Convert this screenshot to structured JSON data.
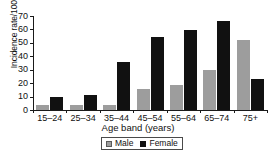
{
  "chart_data": {
    "type": "bar",
    "title": "",
    "xlabel": "Age band (years)",
    "ylabel": "Incidence rate/100 000",
    "categories": [
      "15–24",
      "25–34",
      "35–44",
      "45–54",
      "55–64",
      "65–74",
      "75+"
    ],
    "series": [
      {
        "name": "Male",
        "color": "#9d9d9d",
        "values": [
          3.5,
          3.5,
          3.5,
          16,
          19,
          30,
          52
        ]
      },
      {
        "name": "Female",
        "color": "#111111",
        "values": [
          9.5,
          11.5,
          36,
          54.5,
          59.5,
          66.5,
          23
        ]
      }
    ],
    "ylim": [
      0,
      70
    ],
    "yticks": [
      0,
      10,
      20,
      30,
      40,
      50,
      60,
      70
    ],
    "ytick_labels": [
      "0",
      "10",
      "20",
      "30",
      "40",
      "50",
      "60",
      "70"
    ],
    "grid": false,
    "legend_position": "bottom-center",
    "legend_entries": [
      "Male",
      "Female"
    ]
  }
}
